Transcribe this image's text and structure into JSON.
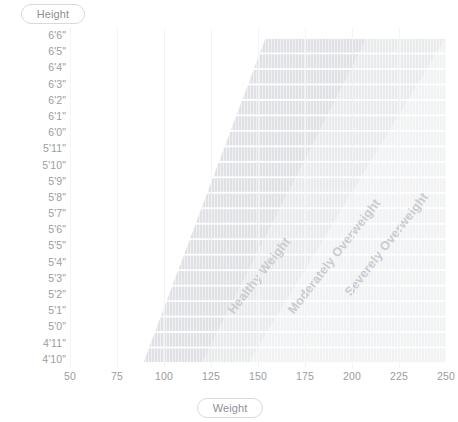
{
  "axes": {
    "y_pill_label": "Height",
    "x_pill_label": "Weight",
    "y_ticks": [
      "6'6\"",
      "6'5\"",
      "6'4\"",
      "6'3\"",
      "6'2\"",
      "6'1\"",
      "6'0\"",
      "5'11\"",
      "5'10\"",
      "5'9\"",
      "5'8\"",
      "5'7\"",
      "5'6\"",
      "5'5\"",
      "5'4\"",
      "5'3\"",
      "5'2\"",
      "5'1\"",
      "5'0\"",
      "4'11\"",
      "4'10\""
    ],
    "x_ticks": [
      "50",
      "75",
      "100",
      "125",
      "150",
      "175",
      "200",
      "225",
      "250"
    ]
  },
  "bands": [
    {
      "name": "healthy-weight",
      "label": "Healthy Weight",
      "color": "#dfe1e4"
    },
    {
      "name": "moderately-overweight",
      "label": "Moderately Overweight",
      "color": "#e8eaec"
    },
    {
      "name": "severely-overweight",
      "label": "Severely Overweight",
      "color": "#f1f2f3"
    }
  ],
  "chart_data": {
    "type": "area",
    "title": "",
    "xlabel": "Weight",
    "ylabel": "Height",
    "xlim": [
      50,
      250
    ],
    "ylim_labels": [
      "4'10\"",
      "6'6\""
    ],
    "grid": "vertical",
    "legend": "inline-band-labels",
    "x_tick_values": [
      50,
      75,
      100,
      125,
      150,
      175,
      200,
      225,
      250
    ],
    "y_tick_values": [
      "6'6\"",
      "6'5\"",
      "6'4\"",
      "6'3\"",
      "6'2\"",
      "6'1\"",
      "6'0\"",
      "5'11\"",
      "5'10\"",
      "5'9\"",
      "5'8\"",
      "5'7\"",
      "5'6\"",
      "5'5\"",
      "5'4\"",
      "5'3\"",
      "5'2\"",
      "5'1\"",
      "5'0\"",
      "4'11\"",
      "4'10\""
    ],
    "series": [
      {
        "name": "Healthy Weight",
        "color": "#dfe1e4",
        "boundary_low": {
          "at_top_height": "6'6\"",
          "weight_top": 154,
          "at_bottom_height": "4'10\"",
          "weight_bottom": 89
        },
        "boundary_high": {
          "at_top_height": "6'6\"",
          "weight_top": 208,
          "at_bottom_height": "4'10\"",
          "weight_bottom": 120
        }
      },
      {
        "name": "Moderately Overweight",
        "color": "#e8eaec",
        "boundary_low": {
          "at_top_height": "6'6\"",
          "weight_top": 208,
          "at_bottom_height": "4'10\"",
          "weight_bottom": 120
        },
        "boundary_high": {
          "at_top_height": "6'6\"",
          "weight_top": 250,
          "at_bottom_height": "4'10\"",
          "weight_bottom": 145
        }
      },
      {
        "name": "Severely Overweight",
        "color": "#f1f2f3",
        "boundary_low": {
          "at_top_height": "6'6\"",
          "weight_top": 250,
          "at_bottom_height": "4'10\"",
          "weight_bottom": 145
        },
        "boundary_high": {
          "at_top_height": "6'6\"",
          "weight_top": 250,
          "at_bottom_height": "4'10\"",
          "weight_bottom": 250
        }
      }
    ]
  }
}
